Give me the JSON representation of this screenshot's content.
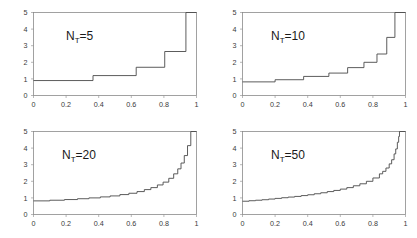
{
  "figure": {
    "title": "",
    "background": "#ffffff",
    "rows": 2,
    "cols": 2
  },
  "chart_data": [
    {
      "type": "line",
      "title": "",
      "annotation": "N_T=5",
      "annotation_base": "N",
      "annotation_sub": "T",
      "annotation_rest": "=5",
      "xlabel": "",
      "ylabel": "",
      "xlim": [
        0,
        1
      ],
      "ylim": [
        0,
        5
      ],
      "xticks": [
        0,
        0.2,
        0.4,
        0.6,
        0.8,
        1
      ],
      "xticklabels": [
        "0",
        "0.2",
        "0.4",
        "0.6",
        "0.8",
        "1"
      ],
      "yticks": [
        0,
        1,
        2,
        3,
        4,
        5
      ],
      "yticklabels": [
        "0",
        "1",
        "2",
        "3",
        "4",
        "5"
      ],
      "grid": false,
      "legend": "none",
      "drawstyle": "steps-post",
      "x": [
        0.0,
        0.365,
        0.365,
        0.63,
        0.63,
        0.805,
        0.805,
        0.935,
        0.935,
        1.0
      ],
      "y": [
        0.9,
        0.9,
        1.2,
        1.2,
        1.7,
        1.7,
        2.65,
        2.65,
        5.0,
        5.0
      ]
    },
    {
      "type": "line",
      "title": "",
      "annotation": "N_T=10",
      "annotation_base": "N",
      "annotation_sub": "T",
      "annotation_rest": "=10",
      "xlabel": "",
      "ylabel": "",
      "xlim": [
        0,
        1
      ],
      "ylim": [
        0,
        5
      ],
      "xticks": [
        0,
        0.2,
        0.4,
        0.6,
        0.8,
        1
      ],
      "xticklabels": [
        "0",
        "0.2",
        "0.4",
        "0.6",
        "0.8",
        "1"
      ],
      "yticks": [
        0,
        1,
        2,
        3,
        4,
        5
      ],
      "yticklabels": [
        "0",
        "1",
        "2",
        "3",
        "4",
        "5"
      ],
      "grid": false,
      "legend": "none",
      "drawstyle": "steps-post",
      "x": [
        0.0,
        0.2,
        0.2,
        0.375,
        0.375,
        0.53,
        0.53,
        0.645,
        0.645,
        0.745,
        0.745,
        0.825,
        0.825,
        0.885,
        0.885,
        0.935,
        0.935,
        1.0
      ],
      "y": [
        0.82,
        0.82,
        0.95,
        0.95,
        1.15,
        1.15,
        1.35,
        1.35,
        1.68,
        1.68,
        2.0,
        2.0,
        2.5,
        2.5,
        3.5,
        3.5,
        5.0,
        5.0
      ]
    },
    {
      "type": "line",
      "title": "",
      "annotation": "N_T=20",
      "annotation_base": "N",
      "annotation_sub": "T",
      "annotation_rest": "=20",
      "xlabel": "",
      "ylabel": "",
      "xlim": [
        0,
        1
      ],
      "ylim": [
        0,
        5
      ],
      "xticks": [
        0,
        0.2,
        0.4,
        0.6,
        0.8,
        1
      ],
      "xticklabels": [
        "0",
        "0.2",
        "0.4",
        "0.6",
        "0.8",
        "1"
      ],
      "yticks": [
        0,
        1,
        2,
        3,
        4,
        5
      ],
      "yticklabels": [
        "0",
        "1",
        "2",
        "3",
        "4",
        "5"
      ],
      "grid": false,
      "legend": "none",
      "drawstyle": "steps-post",
      "x": [
        0.0,
        0.1,
        0.19,
        0.27,
        0.34,
        0.41,
        0.47,
        0.53,
        0.585,
        0.635,
        0.68,
        0.72,
        0.76,
        0.795,
        0.83,
        0.86,
        0.885,
        0.905,
        0.925,
        0.945,
        0.965,
        1.0
      ],
      "y": [
        0.82,
        0.86,
        0.9,
        0.95,
        1.0,
        1.06,
        1.12,
        1.2,
        1.28,
        1.38,
        1.5,
        1.62,
        1.78,
        1.95,
        2.18,
        2.45,
        2.75,
        3.1,
        3.55,
        4.15,
        5.0,
        5.0
      ]
    },
    {
      "type": "line",
      "title": "",
      "annotation": "N_T=50",
      "annotation_base": "N",
      "annotation_sub": "T",
      "annotation_rest": "=50",
      "xlabel": "",
      "ylabel": "",
      "xlim": [
        0,
        1
      ],
      "ylim": [
        0,
        5
      ],
      "xticks": [
        0,
        0.2,
        0.4,
        0.6,
        0.8,
        1
      ],
      "xticklabels": [
        "0",
        "0.2",
        "0.4",
        "0.6",
        "0.8",
        "1"
      ],
      "yticks": [
        0,
        1,
        2,
        3,
        4,
        5
      ],
      "yticklabels": [
        "0",
        "1",
        "2",
        "3",
        "4",
        "5"
      ],
      "grid": false,
      "legend": "none",
      "drawstyle": "steps-post",
      "x": [
        0.0,
        0.04,
        0.08,
        0.12,
        0.16,
        0.2,
        0.24,
        0.28,
        0.32,
        0.36,
        0.4,
        0.44,
        0.48,
        0.52,
        0.56,
        0.6,
        0.64,
        0.68,
        0.72,
        0.76,
        0.8,
        0.84,
        0.86,
        0.88,
        0.9,
        0.915,
        0.93,
        0.94,
        0.95,
        0.958,
        0.963,
        1.0
      ],
      "y": [
        0.8,
        0.83,
        0.86,
        0.89,
        0.93,
        0.97,
        1.01,
        1.05,
        1.09,
        1.14,
        1.19,
        1.25,
        1.31,
        1.38,
        1.45,
        1.53,
        1.62,
        1.73,
        1.85,
        2.0,
        2.2,
        2.45,
        2.6,
        2.8,
        3.05,
        3.3,
        3.65,
        3.95,
        4.35,
        4.7,
        5.0,
        5.0
      ]
    }
  ]
}
